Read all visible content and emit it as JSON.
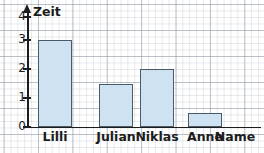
{
  "chart_data": {
    "type": "bar",
    "title": "",
    "xlabel": "Name",
    "ylabel": "Zeit",
    "categories": [
      "Lilli",
      "Julian",
      "Niklas",
      "Anne"
    ],
    "values": [
      3,
      1.5,
      2,
      0.5
    ],
    "ylim": [
      0,
      4
    ],
    "yticks": [
      0,
      1,
      2,
      3,
      4
    ],
    "ytick_labels": [
      "0",
      "1",
      "2",
      "3",
      "4"
    ],
    "grid": true,
    "legend": null,
    "bar_fill_color": "#cfe2f1",
    "bar_border_color": "#4a5a66",
    "axis_color": "#1c1c1c",
    "grid_color": "#969ea8",
    "background_color": "#ffffff"
  },
  "axis": {
    "y_title": "Zeit",
    "x_title": "Name"
  }
}
